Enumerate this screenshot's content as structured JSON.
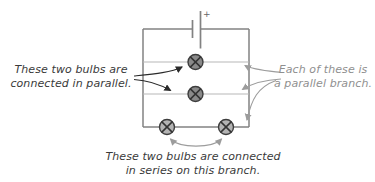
{
  "figure": {
    "type": "circuit-diagram",
    "battery": {
      "plus_label": "+"
    },
    "bulb_count": 4,
    "annotations": {
      "left": {
        "line1": "These two bulbs are",
        "line2": "connected in parallel."
      },
      "right": {
        "line1": "Each of these is",
        "line2": "a parallel branch."
      },
      "bottom": {
        "line1": "These two bulbs are connected",
        "line2": "in series on this branch."
      }
    }
  },
  "colors": {
    "wire": "#828282",
    "branch_wire": "#b8b8b8",
    "bulb_fill_parallel": "#8a8a8a",
    "bulb_fill_series": "#b3b3b3",
    "bulb_stroke": "#3d3d3d",
    "bulb_cross": "#333333",
    "black_arrow": "#2a2a2a",
    "gray_arrow": "#9c9c9c",
    "dark_text": "#3a3a3a",
    "gray_text": "#8f8f8f",
    "plus_text": "#666666"
  }
}
